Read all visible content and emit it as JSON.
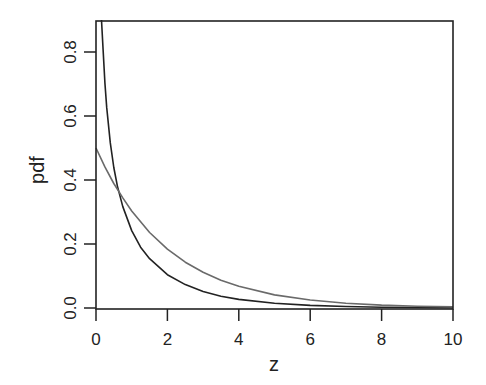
{
  "chart_data": {
    "type": "line",
    "title": "",
    "xlabel": "z",
    "ylabel": "pdf",
    "xlim": [
      0,
      10
    ],
    "ylim": [
      0,
      0.9
    ],
    "grid": false,
    "legend": null,
    "x_ticks": [
      "0",
      "2",
      "4",
      "6",
      "8",
      "10"
    ],
    "y_ticks": [
      "0.0",
      "0.2",
      "0.4",
      "0.6",
      "0.8"
    ],
    "series": [
      {
        "name": "chi-squared df=1",
        "color": "#222222",
        "x": [
          0.155,
          0.2,
          0.25,
          0.3,
          0.4,
          0.5,
          0.6,
          0.75,
          1.0,
          1.25,
          1.5,
          2.0,
          2.5,
          3.0,
          3.5,
          4.0,
          5.0,
          6.0,
          7.0,
          8.0,
          9.0,
          10.0
        ],
        "y": [
          0.9,
          0.807,
          0.704,
          0.627,
          0.516,
          0.439,
          0.381,
          0.317,
          0.242,
          0.19,
          0.154,
          0.104,
          0.0732,
          0.0514,
          0.0366,
          0.027,
          0.0146,
          0.0081,
          0.0046,
          0.0026,
          0.0015,
          0.00085
        ]
      },
      {
        "name": "chi-squared df=2",
        "color": "#6a6a6a",
        "x": [
          0,
          0.25,
          0.5,
          0.75,
          1.0,
          1.5,
          2.0,
          2.5,
          3.0,
          3.5,
          4.0,
          5.0,
          6.0,
          7.0,
          8.0,
          9.0,
          10.0
        ],
        "y": [
          0.5,
          0.441,
          0.389,
          0.344,
          0.303,
          0.236,
          0.184,
          0.143,
          0.112,
          0.087,
          0.068,
          0.041,
          0.025,
          0.015,
          0.009,
          0.0056,
          0.0034
        ]
      }
    ]
  }
}
